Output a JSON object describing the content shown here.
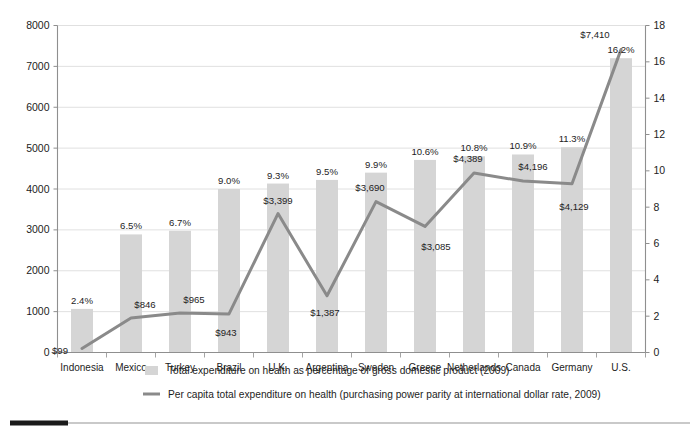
{
  "chart_data": {
    "type": "bar",
    "title": "",
    "subtitle": "",
    "xlabel": "",
    "ylabel": "",
    "grid": true,
    "legend_position": "bottom",
    "categories": [
      "Indonesia",
      "Mexico",
      "Turkey",
      "Brazil",
      "U.K.",
      "Argentina",
      "Sweden",
      "Greece",
      "Netherlands",
      "Canada",
      "Germany",
      "U.S."
    ],
    "axes": {
      "left": {
        "name": "Per capita total expenditure on health (international $)",
        "min": 0,
        "max": 8000,
        "step": 1000,
        "ticks": [
          "0",
          "1000",
          "2000",
          "3000",
          "4000",
          "5000",
          "6000",
          "7000",
          "8000"
        ]
      },
      "right": {
        "name": "Total expenditure on health as percentage of GDP",
        "min": 0,
        "max": 18,
        "step": 2,
        "ticks": [
          "0",
          "2",
          "4",
          "6",
          "8",
          "10",
          "12",
          "14",
          "16",
          "18"
        ]
      }
    },
    "series": [
      {
        "name": "Total expenditure on health as percentage of gross domestic product (2009)",
        "kind": "bar",
        "axis": "right",
        "unit": "%",
        "color": "#d5d5d5",
        "values": [
          2.4,
          6.5,
          6.7,
          9.0,
          9.3,
          9.5,
          9.9,
          10.6,
          10.8,
          10.9,
          11.3,
          16.2
        ],
        "labels": [
          "2.4%",
          "6.5%",
          "6.7%",
          "9.0%",
          "9.3%",
          "9.5%",
          "9.9%",
          "10.6%",
          "10.8%",
          "10.9%",
          "11.3%",
          "16.2%"
        ]
      },
      {
        "name": "Per capita total expenditure on health (purchasing power parity at international dollar rate, 2009)",
        "kind": "line",
        "axis": "left",
        "unit": "$",
        "color": "#8a8a8a",
        "values": [
          99,
          846,
          965,
          943,
          3399,
          1387,
          3690,
          3085,
          4389,
          4196,
          4129,
          7410
        ],
        "labels": [
          "$99",
          "$846",
          "$965",
          "$943",
          "$3,399",
          "$1,387",
          "$3,690",
          "$3,085",
          "$4,389",
          "$4,196",
          "$4,129",
          "$7,410"
        ]
      }
    ]
  },
  "legend": {
    "items": [
      {
        "marker": "bar-swatch",
        "label": "Total expenditure on health as percentage of gross domestic product (2009)",
        "color": "#d5d5d5"
      },
      {
        "marker": "line-swatch",
        "label": "Per capita total expenditure on health (purchasing power parity at international dollar rate, 2009)",
        "color": "#8a8a8a"
      }
    ]
  }
}
